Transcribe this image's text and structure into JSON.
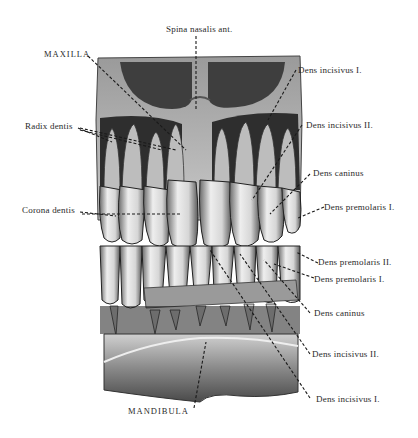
{
  "figure": {
    "type": "anatomical-illustration",
    "colors": {
      "background": "#ffffff",
      "ink": "#2a2a2a",
      "bone_dark": "#3a3a3a",
      "bone_mid": "#8a8a8a",
      "tooth_light": "#e8e8e8"
    }
  },
  "labels": {
    "spina_nasalis": "Spina nasalis ant.",
    "maxilla": "MAXILLA",
    "radix_dentis": "Radix dentis",
    "corona_dentis": "Corona dentis",
    "upper_incisivus_1": "Dens incisivus I.",
    "upper_incisivus_2": "Dens incisivus II.",
    "upper_caninus": "Dens caninus",
    "upper_premolaris_1": "Dens premolaris I.",
    "lower_premolaris_2": "Dens premolaris II.",
    "lower_premolaris_1": "Dens premolaris I.",
    "lower_caninus": "Dens caninus",
    "lower_incisivus_2": "Dens incisivus II.",
    "lower_incisivus_1": "Dens incisivus I.",
    "mandibula": "MANDIBULA"
  }
}
